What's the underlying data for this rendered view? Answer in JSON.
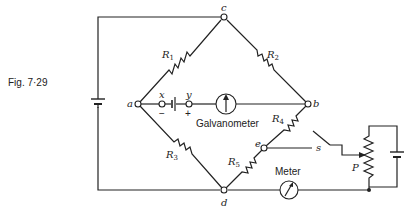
{
  "figure": {
    "caption": "Fig. 7·29"
  },
  "nodes": {
    "a": "a",
    "b": "b",
    "c": "c",
    "d": "d",
    "e": "e",
    "x": "x",
    "y": "y",
    "s": "s",
    "P": "P"
  },
  "resistors": {
    "r1": {
      "letter": "R",
      "sub": "1"
    },
    "r2": {
      "letter": "R",
      "sub": "2"
    },
    "r3": {
      "letter": "R",
      "sub": "3"
    },
    "r4": {
      "letter": "R",
      "sub": "4"
    },
    "r5": {
      "letter": "R",
      "sub": "5"
    }
  },
  "polarity": {
    "minus": "−",
    "plus": "+"
  },
  "instruments": {
    "galvanometer": "Galvanometer",
    "meter": "Meter"
  }
}
